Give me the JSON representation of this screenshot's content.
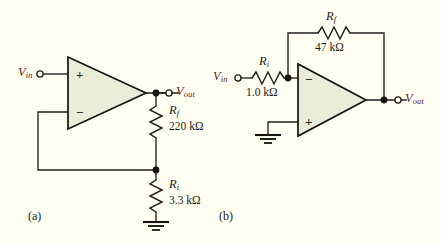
{
  "figure": {
    "background_color": "#fffff2",
    "opamp_fill_color": "#e9ecd6",
    "wire_color": "#201d1a",
    "label_accent_color": "#5b1d17"
  },
  "circuits": [
    {
      "id": "a",
      "caption": "(a)",
      "type": "non-inverting-amplifier",
      "input_label": "V",
      "input_sub": "in",
      "output_label": "V",
      "output_sub": "out",
      "opamp": {
        "plus_sign": "+",
        "minus_sign": "−",
        "plus_position": "top",
        "minus_position": "bottom"
      },
      "resistors": [
        {
          "name": "R",
          "sub": "f",
          "value": "220 kΩ",
          "orientation": "vertical"
        },
        {
          "name": "R",
          "sub": "i",
          "value": "3.3 kΩ",
          "orientation": "vertical"
        }
      ],
      "ground": true
    },
    {
      "id": "b",
      "caption": "(b)",
      "type": "inverting-amplifier",
      "input_label": "V",
      "input_sub": "in",
      "output_label": "V",
      "output_sub": "out",
      "opamp": {
        "plus_sign": "+",
        "minus_sign": "−",
        "plus_position": "bottom",
        "minus_position": "top"
      },
      "resistors": [
        {
          "name": "R",
          "sub": "f",
          "value": "47 kΩ",
          "orientation": "horizontal"
        },
        {
          "name": "R",
          "sub": "i",
          "value": "1.0 kΩ",
          "orientation": "horizontal"
        }
      ],
      "ground": true
    }
  ]
}
